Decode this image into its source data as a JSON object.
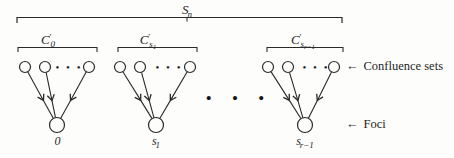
{
  "figure": {
    "outer_set": {
      "base": "S",
      "prime": "",
      "sub_base": "n",
      "sub_sub": ""
    },
    "groups": [
      {
        "bracket_label": {
          "base": "C",
          "prime": "′",
          "sub_base": "0",
          "sub_sub": ""
        },
        "node_ellipsis": "• • •",
        "focus_label": {
          "base": "0",
          "sub_base": "",
          "sub_sub": ""
        }
      },
      {
        "bracket_label": {
          "base": "C",
          "prime": "′",
          "sub_base": "s",
          "sub_sub": "1"
        },
        "node_ellipsis": "• • •",
        "focus_label": {
          "base": "s",
          "sub_base": "1",
          "sub_sub": ""
        }
      },
      {
        "bracket_label": {
          "base": "C",
          "prime": "′",
          "sub_base": "s",
          "sub_sub": "r−1"
        },
        "node_ellipsis": "• • •",
        "focus_label": {
          "base": "s",
          "sub_base": "r−1",
          "sub_sub": ""
        }
      }
    ],
    "groups_ellipsis": "• • •",
    "annotations": {
      "confluence_arrow": "←",
      "confluence_text": "Confluence sets",
      "foci_arrow": "←",
      "foci_text": "Foci"
    },
    "colors": {
      "ink": "#2a2a2a",
      "background": "#fdfdfc"
    }
  }
}
